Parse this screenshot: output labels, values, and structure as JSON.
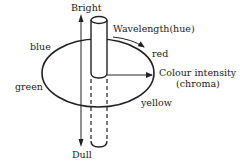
{
  "diagram": {
    "type": "colour-solid",
    "colors": {
      "stroke": "#222222",
      "background": "#ffffff"
    },
    "axes": {
      "vertical": {
        "top_label": "Bright",
        "bottom_label": "Dull"
      },
      "circumference": {
        "label": "Wavelength(hue)"
      },
      "radial": {
        "label_line1": "Colour intensity",
        "label_line2": "(chroma)"
      }
    },
    "hues": [
      {
        "name": "blue"
      },
      {
        "name": "red"
      },
      {
        "name": "green"
      },
      {
        "name": "yellow"
      }
    ]
  }
}
